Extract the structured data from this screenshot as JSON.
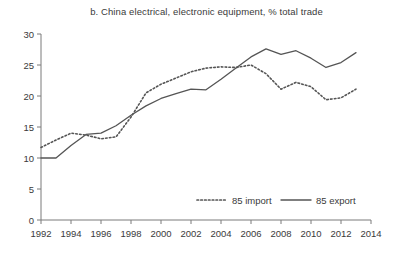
{
  "chart_data": {
    "type": "line",
    "title": "b. China electrical, electronic equipment, % total trade",
    "xlabel": "",
    "ylabel": "",
    "xlim": [
      1992,
      2014
    ],
    "ylim": [
      0,
      30
    ],
    "grid": false,
    "legend_position": "bottom-center",
    "x": [
      1992,
      1993,
      1994,
      1995,
      1996,
      1997,
      1998,
      1999,
      2000,
      2001,
      2002,
      2003,
      2004,
      2005,
      2006,
      2007,
      2008,
      2009,
      2010,
      2011,
      2012,
      2013
    ],
    "xticks": [
      1992,
      1994,
      1996,
      1998,
      2000,
      2002,
      2004,
      2006,
      2008,
      2010,
      2012,
      2014
    ],
    "xticklabels": [
      "1992",
      "1994",
      "1996",
      "1998",
      "2000",
      "2002",
      "2004",
      "2006",
      "2008",
      "2010",
      "2012",
      "2014"
    ],
    "yticks": [
      0,
      5,
      10,
      15,
      20,
      25,
      30
    ],
    "yticklabels": [
      "0",
      "5",
      "10",
      "15",
      "20",
      "25",
      "30"
    ],
    "series": [
      {
        "name": "85 import",
        "style": "dotted",
        "color": "#555555",
        "values": [
          11.7,
          12.9,
          14.0,
          13.7,
          13.1,
          13.4,
          16.6,
          20.5,
          21.9,
          22.9,
          23.9,
          24.5,
          24.7,
          24.6,
          25.0,
          23.6,
          21.1,
          22.2,
          21.5,
          19.4,
          19.7,
          21.1
        ]
      },
      {
        "name": "85 export",
        "style": "solid",
        "color": "#555555",
        "values": [
          10.0,
          10.0,
          12.0,
          13.8,
          14.0,
          15.2,
          16.9,
          18.4,
          19.6,
          20.4,
          21.1,
          21.0,
          22.7,
          24.5,
          26.3,
          27.6,
          26.7,
          27.3,
          26.1,
          24.6,
          25.4,
          27.0
        ]
      }
    ],
    "legend": [
      {
        "label": "85 import",
        "style": "dotted"
      },
      {
        "label": "85 export",
        "style": "solid"
      }
    ]
  }
}
